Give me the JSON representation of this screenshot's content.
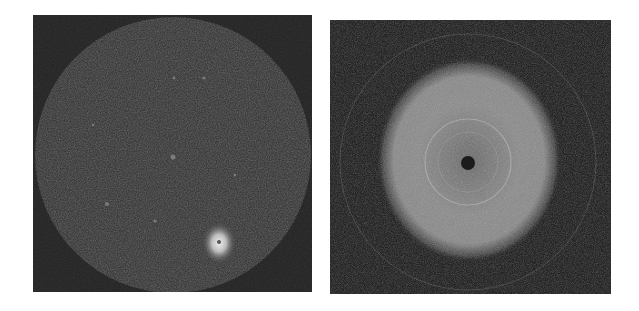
{
  "figure": {
    "panels": [
      {
        "id": "left",
        "description": "Circular detector image with dark noisy background, faint scattered spots and one bright spot near bottom right",
        "background": "#2a2a2a",
        "disk_color": "#3a3a3a",
        "bright_spot_color": "#e8e8e8"
      },
      {
        "id": "right",
        "description": "Diffraction pattern with broad bright diffuse disk, faint concentric rings and dark central spot",
        "background": "#262626",
        "halo_color": "#8a8a8a",
        "center_color": "#1a1a1a"
      }
    ]
  }
}
